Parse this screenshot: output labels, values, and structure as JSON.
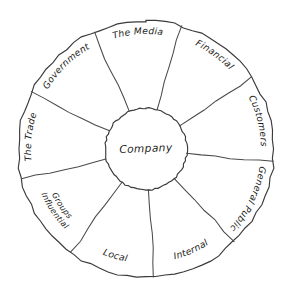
{
  "diagram": {
    "center_label": "Company",
    "background_color": "#ffffff",
    "stroke_color": "#3a3a3c",
    "text_color": "#1d1d20",
    "style": "hand-drawn",
    "segment_count": 9,
    "rotation_degrees": -4,
    "geometry": {
      "center_x": 146,
      "center_y": 149,
      "outer_radius": 128,
      "inner_radius": 41
    },
    "segments": [
      {
        "id": "the-media",
        "label": "The Media",
        "label_lines": [
          "The Media"
        ],
        "position": "top",
        "flipped": false
      },
      {
        "id": "financial",
        "label": "Financial",
        "label_lines": [
          "Financial"
        ],
        "position": "upper-right",
        "flipped": false
      },
      {
        "id": "customers",
        "label": "Customers",
        "label_lines": [
          "Customers"
        ],
        "position": "right",
        "flipped": false
      },
      {
        "id": "general-public",
        "label": "General Public",
        "label_lines": [
          "General Public"
        ],
        "position": "lower-right",
        "flipped": false
      },
      {
        "id": "internal",
        "label": "Internal",
        "label_lines": [
          "Internal"
        ],
        "position": "bottom-right",
        "flipped": true
      },
      {
        "id": "local",
        "label": "Local",
        "label_lines": [
          "Local"
        ],
        "position": "bottom-left",
        "flipped": true
      },
      {
        "id": "influential-groups",
        "label": "Influential Groups",
        "label_lines": [
          "Influential",
          "Groups"
        ],
        "position": "lower-left",
        "flipped": true
      },
      {
        "id": "the-trade",
        "label": "The Trade",
        "label_lines": [
          "The Trade"
        ],
        "position": "left",
        "flipped": false
      },
      {
        "id": "government",
        "label": "Government",
        "label_lines": [
          "Government"
        ],
        "position": "upper-left",
        "flipped": false
      }
    ]
  }
}
